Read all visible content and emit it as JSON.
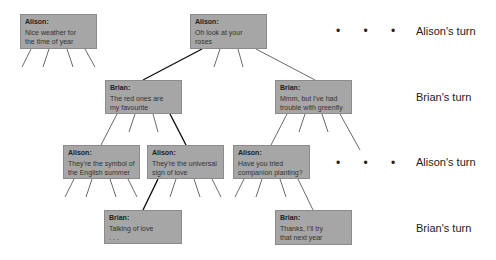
{
  "nodes": [
    {
      "id": "n1",
      "speaker": "Alison:",
      "text": "Nice weather for\nthe time of year"
    },
    {
      "id": "n2",
      "speaker": "Alison:",
      "text": "Oh look at your\nroses"
    },
    {
      "id": "n3",
      "speaker": "Brian:",
      "text": "The red ones are\nmy favourite"
    },
    {
      "id": "n4",
      "speaker": "Brian:",
      "text": "Mmm, but I've had\ntrouble with greenfly"
    },
    {
      "id": "n5",
      "speaker": "Alison:",
      "text": "They're the symbol of\nthe English summer"
    },
    {
      "id": "n6",
      "speaker": "Alison:",
      "text": "They're the universal\nsign of love"
    },
    {
      "id": "n7",
      "speaker": "Alison:",
      "text": "Have you tried\ncompanion planting?"
    },
    {
      "id": "n8",
      "speaker": "Brian:",
      "text": "Talking of love\n. . ."
    },
    {
      "id": "n9",
      "speaker": "Brian:",
      "text": "Thanks, I'll try\nthat next year"
    }
  ],
  "turn_labels": [
    "Alison's turn",
    "Brian's turn",
    "Alison's turn",
    "Brian's turn"
  ],
  "ellipsis": "• • •",
  "colors": {
    "node_fill": "#a6a6a6",
    "node_border": "#8c8c8c",
    "line": "#333333",
    "chosen_line": "#111111"
  }
}
